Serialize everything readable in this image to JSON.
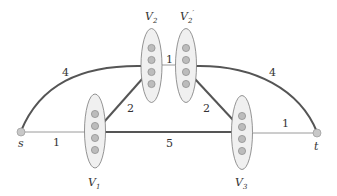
{
  "diagram": {
    "source": {
      "label": "s",
      "x": 21,
      "y": 132
    },
    "sink": {
      "label": "t",
      "x": 317,
      "y": 133
    },
    "clusters": [
      {
        "id": "V1",
        "label": "V",
        "sub": "1",
        "prime": "",
        "cx": 95,
        "cy": 131,
        "rx": 10.5,
        "ry": 37,
        "nodes": 4
      },
      {
        "id": "V2",
        "label": "V",
        "sub": "2",
        "prime": "",
        "cx": 151.5,
        "cy": 65.5,
        "rx": 10.5,
        "ry": 37,
        "nodes": 4
      },
      {
        "id": "V2p",
        "label": "V",
        "sub": "2",
        "prime": "′",
        "cx": 186,
        "cy": 65.5,
        "rx": 10.5,
        "ry": 37,
        "nodes": 4
      },
      {
        "id": "V3",
        "label": "V",
        "sub": "3",
        "prime": "",
        "cx": 242,
        "cy": 132.5,
        "rx": 10.5,
        "ry": 37,
        "nodes": 4
      }
    ],
    "edges": [
      {
        "from": "s",
        "to": "V2",
        "weight": "4",
        "style": "thick"
      },
      {
        "from": "s",
        "to": "V1",
        "weight": "1",
        "style": "thin"
      },
      {
        "from": "V1",
        "to": "V2",
        "weight": "2",
        "style": "thick"
      },
      {
        "from": "V1",
        "to": "V3",
        "weight": "5",
        "style": "thick"
      },
      {
        "from": "V2",
        "to": "V2p",
        "weight": "1",
        "style": "thin"
      },
      {
        "from": "V2p",
        "to": "V3",
        "weight": "2",
        "style": "thick"
      },
      {
        "from": "V2p",
        "to": "t",
        "weight": "4",
        "style": "thick"
      },
      {
        "from": "V3",
        "to": "t",
        "weight": "1",
        "style": "thin"
      }
    ],
    "colors": {
      "thick_edge": "#555555",
      "thin_edge": "#999999",
      "ellipse_fill": "#eeeeee",
      "ellipse_stroke": "#777777",
      "node_fill": "#bbbbbb",
      "node_stroke": "#888888"
    }
  },
  "labels": {
    "s": "s",
    "t": "t",
    "v1": "V",
    "v1_sub": "1",
    "v2": "V",
    "v2_sub": "2",
    "v2p": "V",
    "v2p_sub": "2",
    "v2p_prime": "′",
    "v3": "V",
    "v3_sub": "3",
    "w_s_v2": "4",
    "w_s_v1": "1",
    "w_v1_v2": "2",
    "w_v1_v3": "5",
    "w_v2_v2p": "1",
    "w_v2p_v3": "2",
    "w_v2p_t": "4",
    "w_v3_t": "1"
  }
}
